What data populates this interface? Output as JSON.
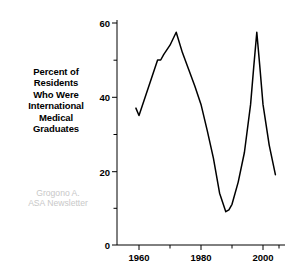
{
  "figure": {
    "background_color": "#ffffff",
    "line_color": "#000000",
    "credit_color": "#c8c8c8"
  },
  "title": {
    "lines": [
      "Percent of",
      "Residents",
      "Who Were",
      "International",
      "Medical",
      "Graduates"
    ]
  },
  "credit": {
    "lines": [
      "Grogono A.",
      "ASA Newsletter"
    ]
  },
  "axes": {
    "y_ticks": [
      "0",
      "20",
      "40",
      "60"
    ],
    "x_ticks": [
      "1960",
      "1980",
      "2000"
    ]
  },
  "chart_data": {
    "type": "line",
    "title": "Percent of Residents Who Were International Medical Graduates",
    "xlabel": "",
    "ylabel": "Percent of Residents Who Were International Medical Graduates",
    "xlim": [
      1955,
      2012
    ],
    "ylim": [
      0,
      60
    ],
    "grid": false,
    "legend": "none",
    "x_tick_values": [
      1960,
      1980,
      2000
    ],
    "x_minor_tick_values": [
      1970,
      1990,
      2010
    ],
    "y_tick_values": [
      0,
      20,
      40,
      60
    ],
    "y_minor_tick_values": [
      10,
      30,
      50
    ],
    "annotation": "Grogono A. ASA Newsletter",
    "series": [
      {
        "name": "Percent IMG Residents",
        "color": "#000000",
        "x": [
          1959,
          1960,
          1962,
          1964,
          1966,
          1967,
          1968,
          1970,
          1972,
          1974,
          1976,
          1978,
          1980,
          1982,
          1984,
          1986,
          1988,
          1989,
          1990,
          1992,
          1994,
          1996,
          1997,
          1998,
          1999,
          2000,
          2002,
          2004
        ],
        "y": [
          37.0,
          35.0,
          40.0,
          45.0,
          50.0,
          50.0,
          51.5,
          54.0,
          57.5,
          52.0,
          47.5,
          43.0,
          38.0,
          31.0,
          23.5,
          14.0,
          9.0,
          9.5,
          11.0,
          17.0,
          25.0,
          38.0,
          48.0,
          57.5,
          48.0,
          38.0,
          27.0,
          19.0
        ]
      }
    ]
  }
}
